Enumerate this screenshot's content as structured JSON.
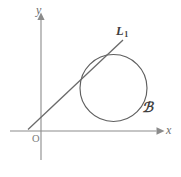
{
  "figure": {
    "kind": "geometry-diagram",
    "background_color": "#ffffff",
    "stroke_color": "#6a6a6a",
    "axis_color": "#8b8b8b",
    "label_color": "#3f3f3f",
    "width": 181,
    "height": 177
  },
  "axes": {
    "x_axis": {
      "label": "x",
      "y": 131,
      "x_start": 10,
      "x_end": 163,
      "arrow": "right"
    },
    "y_axis": {
      "label": "y",
      "x": 41,
      "y_start": 160,
      "y_end": 13,
      "arrow": "up"
    },
    "origin": {
      "label": "O",
      "x": 41,
      "y": 131
    }
  },
  "shapes": {
    "circle": {
      "label": "C",
      "label_glyph": "ℬ",
      "center_x": 113.5,
      "center_y": 88,
      "radius": 33.5
    },
    "line": {
      "label": "L",
      "label_subscript": "1",
      "x1": 28,
      "y1": 129.5,
      "x2": 123,
      "y2": 40,
      "relation": "tangent"
    }
  }
}
